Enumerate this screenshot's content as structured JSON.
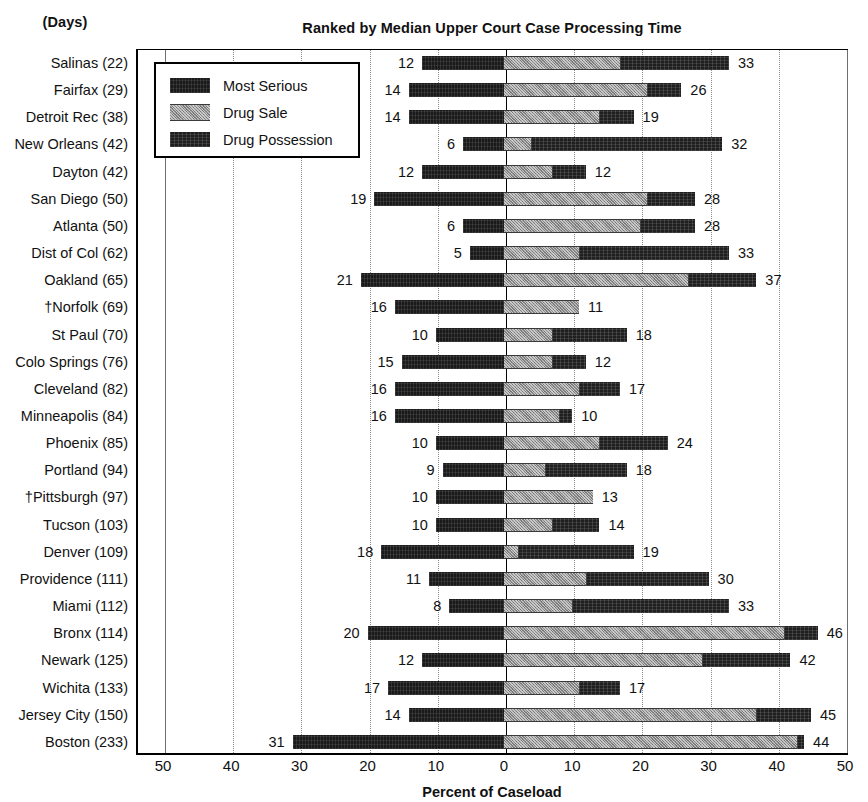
{
  "header": {
    "days_label": "(Days)",
    "title": "Ranked by Median Upper Court Case Processing Time"
  },
  "legend": {
    "items": [
      {
        "label": "Most Serious",
        "swatch": "solid-black-swatch",
        "color": "#1a1a1a"
      },
      {
        "label": "Drug Sale",
        "swatch": "hatched-gray-swatch",
        "color": "#8e8e8e"
      },
      {
        "label": "Drug Possession",
        "swatch": "textured-black-swatch",
        "color": "#1f1f1f"
      }
    ]
  },
  "axis": {
    "title": "Percent of Caseload",
    "ticks": [
      {
        "label": "50",
        "value": -50
      },
      {
        "label": "40",
        "value": -40
      },
      {
        "label": "30",
        "value": -30
      },
      {
        "label": "20",
        "value": -20
      },
      {
        "label": "10",
        "value": -10
      },
      {
        "label": "0",
        "value": 0
      },
      {
        "label": "10",
        "value": 10
      },
      {
        "label": "20",
        "value": 20
      },
      {
        "label": "30",
        "value": 30
      },
      {
        "label": "40",
        "value": 40
      },
      {
        "label": "50",
        "value": 50
      }
    ]
  },
  "chart_data": {
    "type": "bar",
    "subtype": "diverging-stacked-horizontal",
    "title": "Ranked by Median Upper Court Case Processing Time",
    "xlabel": "Percent of Caseload",
    "ylabel": "(Days)",
    "xlim": [
      -55,
      55
    ],
    "grid": true,
    "legend_position": "top-left-inside",
    "series": [
      {
        "name": "Most Serious",
        "side": "left"
      },
      {
        "name": "Drug Sale",
        "side": "right"
      },
      {
        "name": "Drug Possession",
        "side": "right"
      }
    ],
    "categories": [
      "Salinas (22)",
      "Fairfax (29)",
      "Detroit Rec (38)",
      "New Orleans (42)",
      "Dayton (42)",
      "San Diego (50)",
      "Atlanta (50)",
      "Dist of Col (62)",
      "Oakland (65)",
      "†Norfolk (69)",
      "St Paul (70)",
      "Colo Springs (76)",
      "Cleveland (82)",
      "Minneapolis (84)",
      "Phoenix (85)",
      "Portland (94)",
      "†Pittsburgh (97)",
      "Tucson (103)",
      "Denver (109)",
      "Providence (111)",
      "Miami (112)",
      "Bronx (114)",
      "Newark (125)",
      "Wichita (133)",
      "Jersey City (150)",
      "Boston (233)"
    ],
    "rows": [
      {
        "category": "Salinas (22)",
        "days": 22,
        "most_serious": 12,
        "drug_sale": 17,
        "drug_total": 33,
        "left_label": "12",
        "right_label": "33"
      },
      {
        "category": "Fairfax (29)",
        "days": 29,
        "most_serious": 14,
        "drug_sale": 21,
        "drug_total": 26,
        "left_label": "14",
        "right_label": "26"
      },
      {
        "category": "Detroit Rec (38)",
        "days": 38,
        "most_serious": 14,
        "drug_sale": 14,
        "drug_total": 19,
        "left_label": "14",
        "right_label": "19"
      },
      {
        "category": "New Orleans (42)",
        "days": 42,
        "most_serious": 6,
        "drug_sale": 4,
        "drug_total": 32,
        "left_label": "6",
        "right_label": "32"
      },
      {
        "category": "Dayton (42)",
        "days": 42,
        "most_serious": 12,
        "drug_sale": 7,
        "drug_total": 12,
        "left_label": "12",
        "right_label": "12"
      },
      {
        "category": "San Diego (50)",
        "days": 50,
        "most_serious": 19,
        "drug_sale": 21,
        "drug_total": 28,
        "left_label": "19",
        "right_label": "28"
      },
      {
        "category": "Atlanta (50)",
        "days": 50,
        "most_serious": 6,
        "drug_sale": 20,
        "drug_total": 28,
        "left_label": "6",
        "right_label": "28"
      },
      {
        "category": "Dist of Col (62)",
        "days": 62,
        "most_serious": 5,
        "drug_sale": 11,
        "drug_total": 33,
        "left_label": "5",
        "right_label": "33"
      },
      {
        "category": "Oakland (65)",
        "days": 65,
        "most_serious": 21,
        "drug_sale": 27,
        "drug_total": 37,
        "left_label": "21",
        "right_label": "37"
      },
      {
        "category": "†Norfolk (69)",
        "days": 69,
        "most_serious": 16,
        "drug_sale": 11,
        "drug_total": 11,
        "left_label": "16",
        "right_label": "11"
      },
      {
        "category": "St Paul (70)",
        "days": 70,
        "most_serious": 10,
        "drug_sale": 7,
        "drug_total": 18,
        "left_label": "10",
        "right_label": "18"
      },
      {
        "category": "Colo Springs (76)",
        "days": 76,
        "most_serious": 15,
        "drug_sale": 7,
        "drug_total": 12,
        "left_label": "15",
        "right_label": "12"
      },
      {
        "category": "Cleveland (82)",
        "days": 82,
        "most_serious": 16,
        "drug_sale": 11,
        "drug_total": 17,
        "left_label": "16",
        "right_label": "17"
      },
      {
        "category": "Minneapolis (84)",
        "days": 84,
        "most_serious": 16,
        "drug_sale": 8,
        "drug_total": 10,
        "left_label": "16",
        "right_label": "10"
      },
      {
        "category": "Phoenix (85)",
        "days": 85,
        "most_serious": 10,
        "drug_sale": 14,
        "drug_total": 24,
        "left_label": "10",
        "right_label": "24"
      },
      {
        "category": "Portland (94)",
        "days": 94,
        "most_serious": 9,
        "drug_sale": 6,
        "drug_total": 18,
        "left_label": "9",
        "right_label": "18"
      },
      {
        "category": "†Pittsburgh (97)",
        "days": 97,
        "most_serious": 10,
        "drug_sale": 13,
        "drug_total": 13,
        "left_label": "10",
        "right_label": "13"
      },
      {
        "category": "Tucson (103)",
        "days": 103,
        "most_serious": 10,
        "drug_sale": 7,
        "drug_total": 14,
        "left_label": "10",
        "right_label": "14"
      },
      {
        "category": "Denver (109)",
        "days": 109,
        "most_serious": 18,
        "drug_sale": 2,
        "drug_total": 19,
        "left_label": "18",
        "right_label": "19"
      },
      {
        "category": "Providence (111)",
        "days": 111,
        "most_serious": 11,
        "drug_sale": 12,
        "drug_total": 30,
        "left_label": "11",
        "right_label": "30"
      },
      {
        "category": "Miami (112)",
        "days": 112,
        "most_serious": 8,
        "drug_sale": 10,
        "drug_total": 33,
        "left_label": "8",
        "right_label": "33"
      },
      {
        "category": "Bronx (114)",
        "days": 114,
        "most_serious": 20,
        "drug_sale": 41,
        "drug_total": 46,
        "left_label": "20",
        "right_label": "46"
      },
      {
        "category": "Newark (125)",
        "days": 125,
        "most_serious": 12,
        "drug_sale": 29,
        "drug_total": 42,
        "left_label": "12",
        "right_label": "42"
      },
      {
        "category": "Wichita (133)",
        "days": 133,
        "most_serious": 17,
        "drug_sale": 11,
        "drug_total": 17,
        "left_label": "17",
        "right_label": "17"
      },
      {
        "category": "Jersey City (150)",
        "days": 150,
        "most_serious": 14,
        "drug_sale": 37,
        "drug_total": 45,
        "left_label": "14",
        "right_label": "45"
      },
      {
        "category": "Boston (233)",
        "days": 233,
        "most_serious": 31,
        "drug_sale": 43,
        "drug_total": 44,
        "left_label": "31",
        "right_label": "44"
      }
    ]
  }
}
